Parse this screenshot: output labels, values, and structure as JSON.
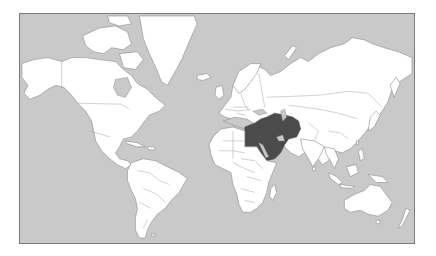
{
  "map": {
    "type": "world political outline map",
    "projection": "Mercator",
    "highlighted_region": "Middle East",
    "colors": {
      "ocean": "#c9c9c9",
      "land": "#ffffff",
      "highlight": "#4b4b4b",
      "border": "#8a8a8a",
      "frame": "#7a7a7a"
    }
  }
}
